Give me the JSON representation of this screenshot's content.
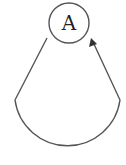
{
  "diagram": {
    "type": "state-diagram",
    "nodes": [
      {
        "id": "A",
        "label": "A",
        "shape": "circle"
      }
    ],
    "edges": [
      {
        "from": "A",
        "to": "A",
        "kind": "self-loop",
        "directed": true,
        "label": ""
      }
    ],
    "colors": {
      "stroke": "#555555",
      "text": "#222222",
      "background": "#ffffff"
    }
  }
}
